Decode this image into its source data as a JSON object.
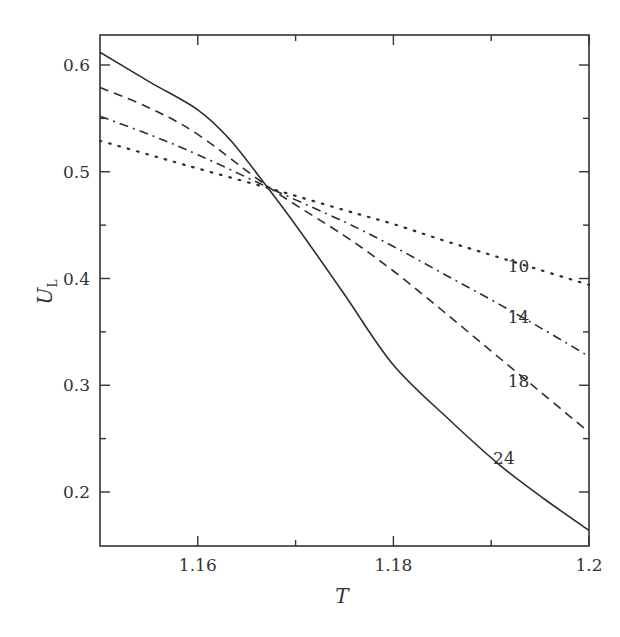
{
  "chart_data": {
    "type": "line",
    "title": "",
    "xlabel": "T",
    "ylabel": "U_L",
    "ylabel_main": "U",
    "ylabel_sub": "L",
    "xlim": [
      1.15,
      1.2
    ],
    "ylim": [
      0.15,
      0.628
    ],
    "grid": false,
    "legend_position": "inline labels at right end of curves",
    "x_ticks": [
      1.16,
      1.18,
      1.2
    ],
    "x_tick_labels": [
      "1.16",
      "1.18",
      "1.2"
    ],
    "x_minor_ticks": [
      1.17,
      1.19
    ],
    "y_ticks": [
      0.2,
      0.3,
      0.4,
      0.5,
      0.6
    ],
    "y_tick_labels": [
      "0.2",
      "0.3",
      "0.4",
      "0.5",
      "0.6"
    ],
    "y_minor_ticks": [
      0.25,
      0.35,
      0.45,
      0.55
    ],
    "crossing_point": {
      "T": 1.1675,
      "U": 0.484
    },
    "series": [
      {
        "name": "10",
        "style": "dotted",
        "points": [
          [
            1.15,
            0.529
          ],
          [
            1.155,
            0.516
          ],
          [
            1.16,
            0.503
          ],
          [
            1.1675,
            0.484
          ],
          [
            1.175,
            0.464
          ],
          [
            1.18,
            0.451
          ],
          [
            1.185,
            0.436
          ],
          [
            1.19,
            0.422
          ],
          [
            1.195,
            0.408
          ],
          [
            1.2,
            0.394
          ]
        ]
      },
      {
        "name": "14",
        "style": "dash-dot",
        "points": [
          [
            1.15,
            0.552
          ],
          [
            1.155,
            0.535
          ],
          [
            1.16,
            0.516
          ],
          [
            1.1675,
            0.484
          ],
          [
            1.175,
            0.453
          ],
          [
            1.18,
            0.43
          ],
          [
            1.185,
            0.405
          ],
          [
            1.19,
            0.38
          ],
          [
            1.195,
            0.354
          ],
          [
            1.2,
            0.327
          ]
        ]
      },
      {
        "name": "18",
        "style": "dashed",
        "points": [
          [
            1.15,
            0.579
          ],
          [
            1.155,
            0.56
          ],
          [
            1.16,
            0.535
          ],
          [
            1.1675,
            0.484
          ],
          [
            1.175,
            0.44
          ],
          [
            1.18,
            0.407
          ],
          [
            1.185,
            0.37
          ],
          [
            1.19,
            0.332
          ],
          [
            1.195,
            0.294
          ],
          [
            1.2,
            0.256
          ]
        ]
      },
      {
        "name": "24",
        "style": "solid",
        "points": [
          [
            1.15,
            0.612
          ],
          [
            1.1551,
            0.584
          ],
          [
            1.16,
            0.558
          ],
          [
            1.1633,
            0.53
          ],
          [
            1.1669,
            0.488
          ],
          [
            1.1704,
            0.445
          ],
          [
            1.175,
            0.385
          ],
          [
            1.18,
            0.319
          ],
          [
            1.1858,
            0.267
          ],
          [
            1.1909,
            0.225
          ],
          [
            1.1955,
            0.193
          ],
          [
            1.2,
            0.164
          ]
        ]
      }
    ],
    "labels": [
      {
        "text": "10",
        "series": "10",
        "T": 1.1928,
        "U": 0.406
      },
      {
        "text": "14",
        "series": "14",
        "T": 1.1928,
        "U": 0.358
      },
      {
        "text": "18",
        "series": "18",
        "T": 1.1928,
        "U": 0.298
      },
      {
        "text": "24",
        "series": "24",
        "T": 1.1913,
        "U": 0.226
      }
    ]
  }
}
